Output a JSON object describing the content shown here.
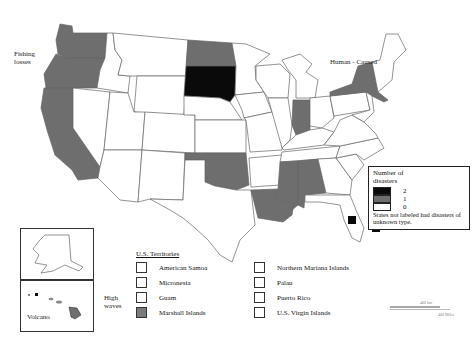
{
  "map": {
    "title": "",
    "colors": {
      "two": "#0a0a0a",
      "one": "#6e6e6e",
      "zero": "#ffffff",
      "border": "#555555"
    },
    "annotations": [
      {
        "id": "fishing",
        "text": "Fishing losses"
      },
      {
        "id": "human",
        "text": "Human - Caused"
      },
      {
        "id": "volcano",
        "text": "Volcano"
      },
      {
        "id": "high_waves",
        "text": "High waves"
      }
    ],
    "states_two_disasters": [
      "South Dakota",
      "Florida (Keys marker)",
      "Florida (offshore marker)"
    ],
    "states_one_disaster": [
      "Washington",
      "Oregon",
      "California",
      "North Dakota",
      "Oklahoma",
      "Indiana",
      "Louisiana",
      "Mississippi",
      "Alabama",
      "New York",
      "Hawaii"
    ]
  },
  "annotations": {
    "fishing_1": "Fishing",
    "fishing_2": "losses",
    "human": "Human - Caused",
    "volcano": "Volcano",
    "high_1": "High",
    "high_2": "waves"
  },
  "legend": {
    "title_1": "Number of",
    "title_2": "disasters",
    "items": [
      {
        "value": "2",
        "color": "#0a0a0a"
      },
      {
        "value": "1",
        "color": "#6e6e6e"
      },
      {
        "value": "0",
        "color": "#ffffff"
      }
    ],
    "note": "States not labeled had disasters of unknown type."
  },
  "territories": {
    "title": "U.S. Territories",
    "items": [
      {
        "label": "American Samoa",
        "value": 0
      },
      {
        "label": "Micronesia",
        "value": 0
      },
      {
        "label": "Guam",
        "value": 0
      },
      {
        "label": "Marshall Islands",
        "value": 1
      },
      {
        "label": "Northern Mariana Islands",
        "value": 0
      },
      {
        "label": "Palau",
        "value": 0
      },
      {
        "label": "Puerto Rico",
        "value": 0
      },
      {
        "label": "U.S. Virgin Islands",
        "value": 0
      }
    ]
  },
  "scale": {
    "km": "400 km",
    "miles": "400 Miles"
  }
}
